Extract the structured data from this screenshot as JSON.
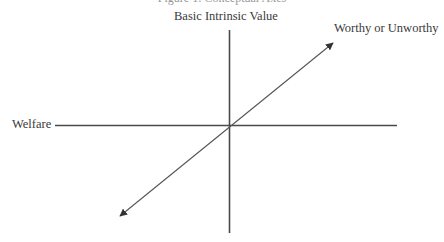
{
  "caption": "Figure 1: Conceptual Axes",
  "axes": {
    "vertical": {
      "label": "Basic Intrinsic Value"
    },
    "horizontal": {
      "label": "Welfare"
    },
    "diagonal": {
      "label": "Worthy or Unworthy",
      "bidirectional": true
    }
  },
  "colors": {
    "line": "#4a4a4a",
    "text": "#3a3a3a"
  }
}
